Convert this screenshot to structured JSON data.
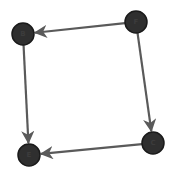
{
  "diagram": {
    "type": "directed-graph",
    "background": "#ffffff",
    "node_color": "#2f2f2f",
    "edge_color": "#5a5a5a",
    "node_radius": 11,
    "nodes": [
      {
        "id": "B",
        "label": "B",
        "x": 23,
        "y": 34
      },
      {
        "id": "F",
        "label": "F",
        "x": 136,
        "y": 22
      },
      {
        "id": "E",
        "label": "E",
        "x": 29,
        "y": 155
      },
      {
        "id": "C",
        "label": "C",
        "x": 153,
        "y": 143
      }
    ],
    "edges": [
      {
        "from": "F",
        "to": "B"
      },
      {
        "from": "F",
        "to": "C"
      },
      {
        "from": "B",
        "to": "E"
      },
      {
        "from": "C",
        "to": "E"
      }
    ]
  }
}
